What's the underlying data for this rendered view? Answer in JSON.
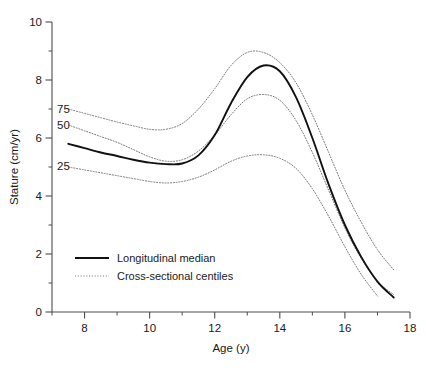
{
  "chart_data": {
    "type": "line",
    "title": "",
    "xlabel": "Age (y)",
    "ylabel": "Stature (cm/yr)",
    "xlim": [
      7,
      18
    ],
    "ylim": [
      0,
      10
    ],
    "xticks": [
      8,
      10,
      12,
      14,
      16,
      18
    ],
    "xticklabels": [
      "8",
      "10",
      "12",
      "14",
      "16",
      "18"
    ],
    "xminorticks": [
      7,
      9,
      11,
      13,
      15,
      17
    ],
    "yticks": [
      0,
      2,
      4,
      6,
      8,
      10
    ],
    "yticklabels": [
      "0",
      "2",
      "4",
      "6",
      "8",
      "10"
    ],
    "yminorticks": [
      1,
      3,
      5,
      7,
      9
    ],
    "grid": false,
    "legend_position": "lower left",
    "annotations": [
      {
        "text": "75",
        "x": 7.35,
        "y": 7.0
      },
      {
        "text": "50",
        "x": 7.35,
        "y": 6.45
      },
      {
        "text": "25",
        "x": 7.35,
        "y": 5.05
      }
    ],
    "series": [
      {
        "name": "Longitudinal median",
        "style": "solid",
        "color": "#111111",
        "x": [
          7.5,
          8.0,
          8.5,
          9.0,
          9.5,
          10.0,
          10.5,
          11.0,
          11.5,
          12.0,
          12.5,
          13.0,
          13.5,
          14.0,
          14.5,
          15.0,
          15.5,
          16.0,
          16.5,
          17.0,
          17.5
        ],
        "values": [
          5.8,
          5.65,
          5.5,
          5.38,
          5.25,
          5.15,
          5.1,
          5.12,
          5.4,
          6.1,
          7.2,
          8.1,
          8.5,
          8.3,
          7.4,
          6.0,
          4.4,
          3.0,
          1.9,
          1.05,
          0.5
        ]
      },
      {
        "name": "Cross-sectional 75th centile",
        "style": "dotted",
        "color": "#7a7a7a",
        "x": [
          7.5,
          8.0,
          8.5,
          9.0,
          9.5,
          10.0,
          10.5,
          11.0,
          11.5,
          12.0,
          12.5,
          13.0,
          13.5,
          14.0,
          14.5,
          15.0,
          15.5,
          16.0,
          16.5,
          17.0,
          17.5
        ],
        "values": [
          7.0,
          6.85,
          6.7,
          6.55,
          6.42,
          6.3,
          6.3,
          6.5,
          7.0,
          7.7,
          8.5,
          8.95,
          8.95,
          8.6,
          7.9,
          6.8,
          5.5,
          4.2,
          3.1,
          2.15,
          1.45
        ]
      },
      {
        "name": "Cross-sectional 50th centile",
        "style": "dotted",
        "color": "#7a7a7a",
        "x": [
          7.5,
          8.0,
          8.5,
          9.0,
          9.5,
          10.0,
          10.5,
          11.0,
          11.5,
          12.0,
          12.5,
          13.0,
          13.5,
          14.0,
          14.5,
          15.0,
          15.5,
          16.0,
          16.5,
          17.0,
          17.5
        ],
        "values": [
          6.45,
          6.25,
          6.05,
          5.85,
          5.6,
          5.35,
          5.2,
          5.25,
          5.55,
          6.1,
          6.8,
          7.35,
          7.5,
          7.3,
          6.6,
          5.5,
          4.2,
          2.9,
          1.85,
          1.05,
          0.6
        ]
      },
      {
        "name": "Cross-sectional 25th centile",
        "style": "dotted",
        "color": "#7a7a7a",
        "x": [
          7.5,
          8.0,
          8.5,
          9.0,
          9.5,
          10.0,
          10.5,
          11.0,
          11.5,
          12.0,
          12.5,
          13.0,
          13.5,
          14.0,
          14.5,
          15.0,
          15.5,
          16.0,
          16.5,
          17.0
        ],
        "values": [
          5.0,
          4.9,
          4.8,
          4.7,
          4.6,
          4.5,
          4.45,
          4.5,
          4.65,
          4.9,
          5.2,
          5.38,
          5.42,
          5.3,
          4.95,
          4.25,
          3.3,
          2.25,
          1.3,
          0.55
        ]
      }
    ],
    "legend": [
      {
        "label": "Longitudinal median",
        "style": "solid"
      },
      {
        "label": "Cross-sectional centiles",
        "style": "dotted"
      }
    ]
  }
}
